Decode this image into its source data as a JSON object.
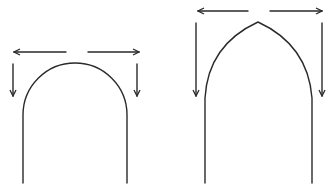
{
  "diagram": {
    "colors": {
      "stroke": "#2a2a2a",
      "background": "#ffffff"
    },
    "figures": [
      {
        "name": "round-arch",
        "shape": "semicircular",
        "arrows": [
          "outward-left",
          "outward-right",
          "down-left",
          "down-right"
        ]
      },
      {
        "name": "pointed-arch",
        "shape": "pointed",
        "arrows": [
          "outward-left",
          "outward-right",
          "down-left",
          "down-right"
        ]
      }
    ]
  }
}
